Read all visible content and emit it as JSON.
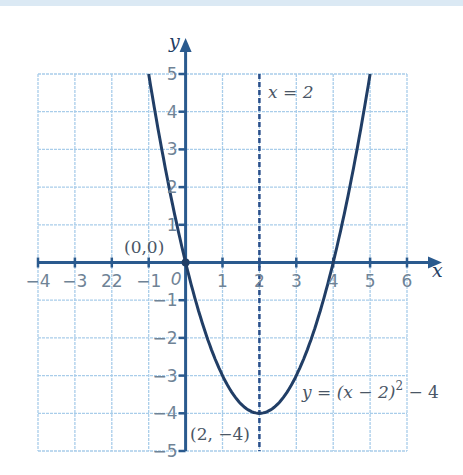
{
  "chart_data": {
    "type": "line",
    "title": "",
    "xlabel": "x",
    "ylabel": "y",
    "xlim": [
      -4,
      6
    ],
    "ylim": [
      -5,
      5
    ],
    "grid": true,
    "x_ticks": [
      "-4",
      "-3",
      "22",
      "-1",
      "",
      "1",
      "2",
      "3",
      "4",
      "5",
      "6"
    ],
    "x_tick_values": [
      -4,
      -3,
      -2,
      -1,
      0,
      1,
      2,
      3,
      4,
      5,
      6
    ],
    "y_ticks": [
      "5",
      "4",
      "3",
      "2",
      "1",
      "-1",
      "-2",
      "-3",
      "-4",
      "-5"
    ],
    "y_tick_values": [
      5,
      4,
      3,
      2,
      1,
      -1,
      -2,
      -3,
      -4,
      -5
    ],
    "origin_label": "0",
    "series": [
      {
        "name": "y = (x - 2)^2 - 4",
        "x": [
          -1,
          -0.5,
          0,
          0.5,
          1,
          1.5,
          2,
          2.5,
          3,
          3.5,
          4,
          4.5,
          5
        ],
        "y": [
          5,
          2.25,
          0,
          -1.75,
          -3,
          -3.75,
          -4,
          -3.75,
          -3,
          -1.75,
          0,
          2.25,
          5
        ]
      }
    ],
    "lines": [
      {
        "name": "axis of symmetry",
        "type": "vertical-dashed",
        "x": 2,
        "label": "x = 2"
      }
    ],
    "points": [
      {
        "x": 0,
        "y": 0,
        "label": "(0,0)"
      },
      {
        "x": 2,
        "y": -4,
        "label": "(2, -4)"
      }
    ],
    "annotations": {
      "curve_label_lhs": "y = (x − 2)",
      "curve_label_exp": "2",
      "curve_label_rhs": " − 4",
      "symmetry_label": "x = 2",
      "origin_point_label": "(0,0)",
      "vertex_label": "(2, −4)"
    }
  },
  "axes": {
    "x_label": "x",
    "y_label": "y",
    "origin": "0"
  },
  "colors": {
    "grid": "#a9cdea",
    "axis": "#2a5a8e",
    "curve": "#213e66",
    "tick_text": "#6f8396",
    "band": "#dbe9f4"
  }
}
